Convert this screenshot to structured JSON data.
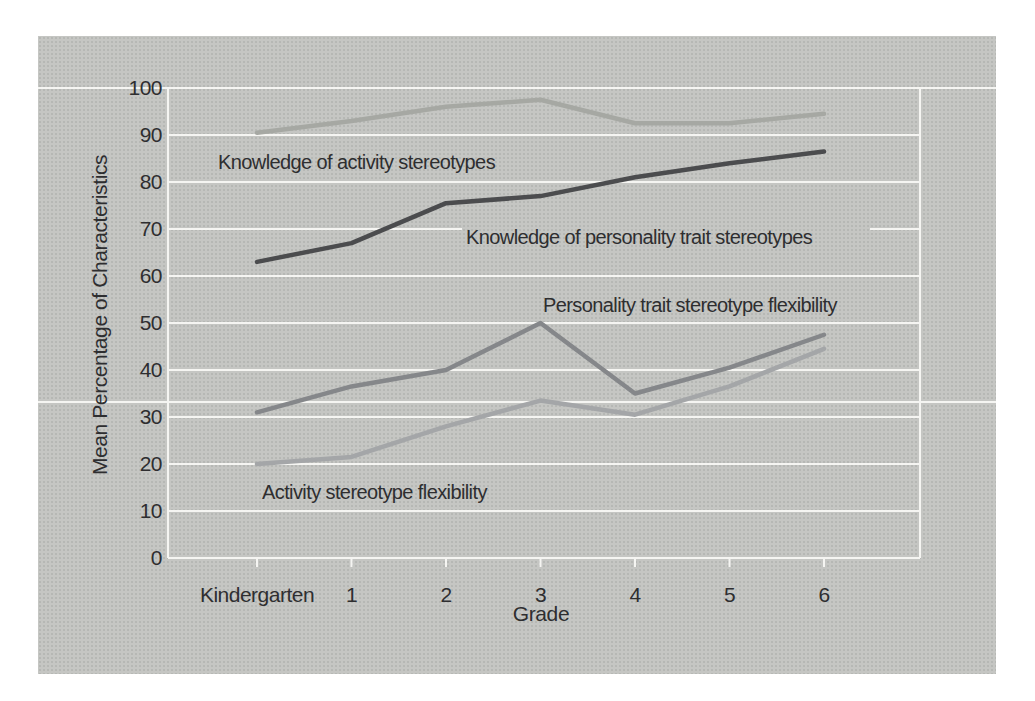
{
  "page": {
    "background": "#ffffff",
    "panel_background": "#c5c6c3",
    "gridline_color": "#f5f5f2",
    "text_color": "#2e2e30"
  },
  "chart_data": {
    "type": "line",
    "title": "",
    "xlabel": "Grade",
    "ylabel": "Mean Percentage of Characteristics",
    "x_categories": [
      "Kindergarten",
      "1",
      "2",
      "3",
      "4",
      "5",
      "6"
    ],
    "yticks": [
      0,
      10,
      20,
      30,
      40,
      50,
      60,
      70,
      80,
      90,
      100
    ],
    "ylim": [
      0,
      100
    ],
    "grid": "horizontal white gridlines on gray panel; top 100-line and one stray scan stripe run full panel width",
    "legend_position": "inline text annotations beside each line",
    "series": [
      {
        "name": "Knowledge of activity stereotypes",
        "color": "#a6a8a3",
        "values": [
          90.5,
          93,
          96,
          97.5,
          92.5,
          92.5,
          94.5
        ]
      },
      {
        "name": "Knowledge of personality trait stereotypes",
        "color": "#4b4c4e",
        "values": [
          63,
          67,
          75.5,
          77,
          81,
          84,
          86.5
        ]
      },
      {
        "name": "Personality trait stereotype flexibility",
        "color": "#85878a",
        "values": [
          31,
          36.5,
          40,
          50,
          35,
          40.5,
          47.5
        ]
      },
      {
        "name": "Activity stereotype flexibility",
        "color": "#a4a6a8",
        "values": [
          20,
          21.5,
          28,
          33.5,
          30.5,
          36.5,
          44.5
        ]
      }
    ]
  }
}
